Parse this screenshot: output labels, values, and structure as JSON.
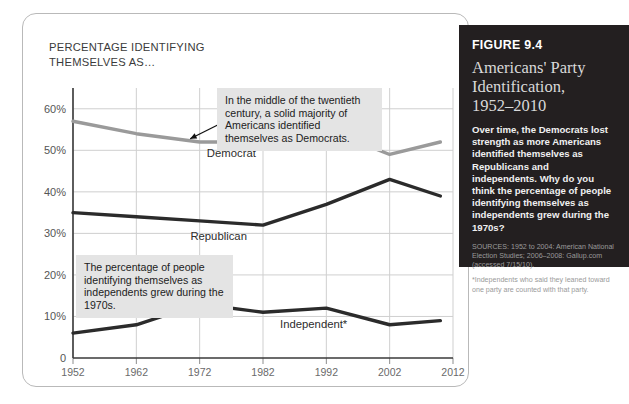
{
  "chart_card": {
    "axis_title": "PERCENTAGE IDENTIFYING\nTHEMSELVES AS…"
  },
  "callouts": {
    "democrat": "In the middle of the twentieth century, a solid majority of Americans identified themselves as Democrats.",
    "independent": "The percentage of people identifying themselves as independents grew during the 1970s."
  },
  "figure_panel": {
    "figure_number": "FIGURE 9.4",
    "title": "Americans' Party\nIdentification,\n1952–2010",
    "body": "Over time, the Democrats lost strength as more Americans identified themselves as Republicans and independents. Why do you think the percentage of people identifying themselves as independents grew during the 1970s?",
    "sources": "SOURCES: 1952 to 2004: American National Election Studies; 2006–2008: Gallup.com (accessed 7/15/10).",
    "note": "*Independents who said they leaned toward one party are counted with that party."
  },
  "chart_data": {
    "type": "line",
    "title": "Americans' Party Identification, 1952–2010",
    "xlabel": "",
    "ylabel": "PERCENTAGE IDENTIFYING THEMSELVES AS…",
    "x": [
      1952,
      1962,
      1972,
      1982,
      1992,
      2002,
      2010
    ],
    "xlim": [
      1952,
      2012
    ],
    "ylim": [
      0,
      65
    ],
    "xticks": [
      1952,
      1962,
      1972,
      1982,
      1992,
      2002,
      2012
    ],
    "yticks": [
      0,
      10,
      20,
      30,
      40,
      50,
      60
    ],
    "ytick_labels": [
      "0",
      "10%",
      "20%",
      "30%",
      "40%",
      "50%",
      "60%"
    ],
    "grid": true,
    "legend": "inline-labels",
    "series": [
      {
        "name": "Democrat",
        "color": "#9a9a9a",
        "values": [
          57,
          54,
          52,
          52,
          55,
          49,
          52
        ]
      },
      {
        "name": "Republican",
        "color": "#2b2b2b",
        "values": [
          35,
          34,
          33,
          32,
          37,
          43,
          39
        ]
      },
      {
        "name": "Independent*",
        "color": "#2b2b2b",
        "values": [
          6,
          8,
          13,
          11,
          12,
          8,
          9
        ]
      }
    ],
    "annotations": [
      "In the middle of the twentieth century, a solid majority of Americans identified themselves as Democrats.",
      "The percentage of people identifying themselves as independents grew during the 1970s."
    ]
  }
}
